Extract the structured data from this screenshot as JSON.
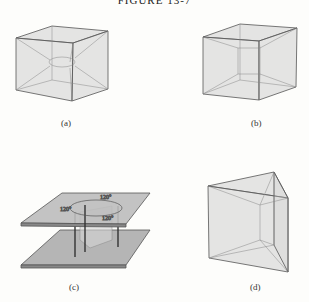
{
  "figure": {
    "title": "FIGURE 13-7",
    "panels": [
      {
        "id": "a",
        "label": "(a)",
        "shape": "cube with concave central surface"
      },
      {
        "id": "b",
        "label": "(b)",
        "shape": "cube with inner square tube surface"
      },
      {
        "id": "c",
        "label": "(c)",
        "shape": "two parallel plates joined by film with three wires",
        "angles": [
          "120°",
          "120°",
          "120°"
        ]
      },
      {
        "id": "d",
        "label": "(d)",
        "shape": "triangular prism frame"
      }
    ]
  },
  "colors": {
    "background": "#fdfdfb",
    "film": "#c8c8c8",
    "edge": "#555555",
    "plate": "#b5b5b5"
  }
}
